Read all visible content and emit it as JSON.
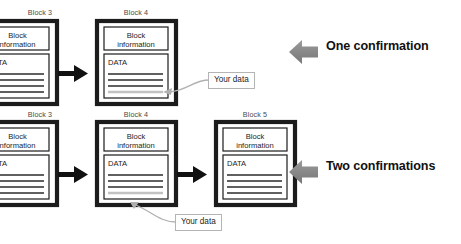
{
  "diagram": {
    "title_visible": false,
    "colors": {
      "block_border": "#1c1c1c",
      "line_dark": "#2b2b2b",
      "line_highlight": "#c2c2c2",
      "flow_arrow": "#111111",
      "confirm_arrow": "#8a8a8a",
      "callout_border": "#b4b4b4",
      "callout_leader": "#b0b0b0",
      "label_text": "#4a4a4a",
      "body_text": "#1d1d1d"
    },
    "rows": [
      {
        "id": "row-one-confirmation",
        "confirmation_label": "One confirmation",
        "confirmation_arrow_icon": "left-arrow-icon",
        "callout": {
          "text": "Your data",
          "target_block": "Block 4"
        },
        "blocks": [
          {
            "label": "Block 3",
            "clipped": true,
            "header_line_1": "Block",
            "header_line_2": "nformation",
            "data_label": "TA",
            "data_lines": 4,
            "highlight_line": false
          },
          {
            "label": "Block 4",
            "clipped": false,
            "header_line_1": "Block",
            "header_line_2": "information",
            "data_label": "DATA",
            "data_lines": 4,
            "highlight_line": true
          }
        ]
      },
      {
        "id": "row-two-confirmations",
        "confirmation_label": "Two confirmations",
        "confirmation_arrow_icon": "left-arrow-icon",
        "callout": {
          "text": "Your data",
          "target_block": "Block 4"
        },
        "blocks": [
          {
            "label": "Block 3",
            "clipped": true,
            "header_line_1": "Block",
            "header_line_2": "nformation",
            "data_label": "TA",
            "data_lines": 4,
            "highlight_line": false
          },
          {
            "label": "Block 4",
            "clipped": false,
            "header_line_1": "Block",
            "header_line_2": "information",
            "data_label": "DATA",
            "data_lines": 4,
            "highlight_line": true
          },
          {
            "label": "Block 5",
            "clipped": false,
            "header_line_1": "Block",
            "header_line_2": "information",
            "data_label": "DATA",
            "data_lines": 4,
            "highlight_line": false
          }
        ]
      }
    ]
  }
}
